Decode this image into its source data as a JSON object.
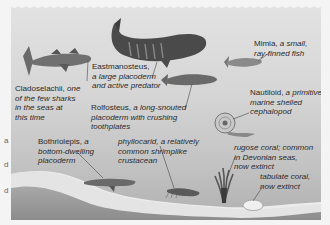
{
  "margin_letters": [
    "a",
    "d",
    "d"
  ],
  "labels": {
    "cladoselachii": {
      "name": "Cladoselachii,",
      "lines": [
        " one",
        "of the few sharks",
        "in the seas at",
        "this time"
      ]
    },
    "eastmanosteus": {
      "name": "Eastmanosteus,",
      "lines": [
        "a large placoderm",
        "and active predator"
      ]
    },
    "mimia": {
      "name": "Mimia,",
      "lines": [
        " a small,",
        "ray-finned fish"
      ]
    },
    "rolfosteus": {
      "name": "Rolfosteus,",
      "lines": [
        " a long-snouted",
        "placoderm with crushing",
        "toothplates"
      ]
    },
    "nautiloid": {
      "name": "Nautiloid,",
      "lines": [
        " a primitive",
        "marine  shelled",
        "cephalopod"
      ]
    },
    "bothriolepis": {
      "name": "Bothriolepis,",
      "lines": [
        " a",
        "bottom-dwelling",
        "placoderm"
      ]
    },
    "phyllocarid": {
      "name": "",
      "lines": [
        "phyllocarid, a relatively",
        "common shrimplike",
        "crustacean"
      ]
    },
    "rugose": {
      "name": "",
      "lines": [
        "rugose coral; common",
        "in Devonian seas,",
        "now extinct"
      ]
    },
    "tabulate": {
      "name": "",
      "lines": [
        "tabulate coral,",
        "now extinct"
      ]
    }
  },
  "colors": {
    "water_top": "#e2e2e2",
    "water_bottom": "#b0b0b0",
    "sediment_light": "#ececec",
    "sediment_dark": "#9a9a9a",
    "creature": "#5a5a5a"
  }
}
